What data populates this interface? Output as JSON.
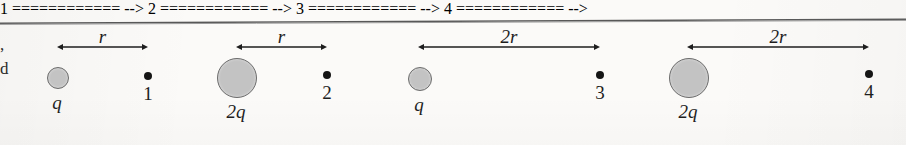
{
  "figure": {
    "type": "physics-diagram",
    "background_color": "#fbfaf8",
    "ink_color": "#1e1e1e",
    "charge_fill_color": "#c3c3c3",
    "charge_stroke_color": "#6d6d6d",
    "dot_color": "#151515",
    "rule_color": "#585858"
  },
  "margin_text": {
    "fragment_top": ",",
    "fragment_bottom": "d"
  },
  "groups": [
    {
      "id": "group-1",
      "charge_label": "q",
      "charge_size": "small",
      "charge_cx": 57,
      "charge_cy": 77,
      "charge_r": 10,
      "distance_label": "r",
      "arrow_x1": 57,
      "arrow_x2": 148,
      "arrow_y": 47,
      "point_label": "1",
      "point_cx": 148,
      "point_cy": 76
    },
    {
      "id": "group-2",
      "charge_label": "2q",
      "charge_size": "large",
      "charge_cx": 236,
      "charge_cy": 77,
      "charge_r": 19,
      "distance_label": "r",
      "arrow_x1": 236,
      "arrow_x2": 327,
      "arrow_y": 47,
      "point_label": "2",
      "point_cx": 327,
      "point_cy": 75
    },
    {
      "id": "group-3",
      "charge_label": "q",
      "charge_size": "small",
      "charge_cx": 419,
      "charge_cy": 78,
      "charge_r": 11,
      "distance_label": "2r",
      "arrow_x1": 418,
      "arrow_x2": 600,
      "arrow_y": 47,
      "point_label": "3",
      "point_cx": 600,
      "point_cy": 75
    },
    {
      "id": "group-4",
      "charge_label": "2q",
      "charge_size": "large",
      "charge_cx": 688,
      "charge_cy": 77,
      "charge_r": 19,
      "distance_label": "2r",
      "arrow_x1": 687,
      "arrow_x2": 869,
      "arrow_y": 47,
      "point_label": "4",
      "point_cx": 869,
      "point_cy": 74
    }
  ]
}
